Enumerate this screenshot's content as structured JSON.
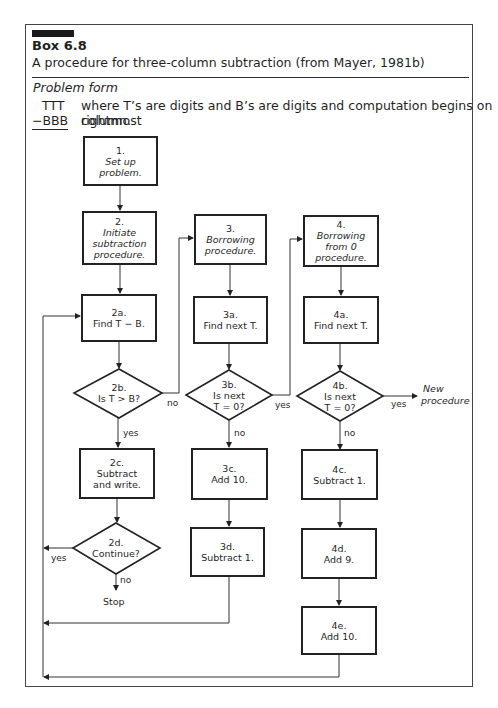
{
  "header": {
    "box_number": "Box 6.8",
    "caption": "A procedure for three-column subtraction (from Mayer, 1981b)"
  },
  "problem_form": {
    "title": "Problem form",
    "top_operand": "TTT",
    "bottom_operand": "−BBB",
    "description_line1": "where T’s are digits and B’s are digits and computation begins on rightmost",
    "description_line2": "column."
  },
  "nodes": {
    "n1": {
      "id": "1.",
      "text": "Set up",
      "text2": "problem.",
      "italic": true
    },
    "n2": {
      "id": "2.",
      "text": "Initiate",
      "text2": "subtraction",
      "text3": "procedure.",
      "italic": true
    },
    "n2a": {
      "id": "2a.",
      "text": "Find T − B."
    },
    "n2b": {
      "id": "2b.",
      "text": "Is T > B?"
    },
    "n2c": {
      "id": "2c.",
      "text": "Subtract",
      "text2": "and write."
    },
    "n2d": {
      "id": "2d.",
      "text": "Continue?"
    },
    "n3": {
      "id": "3.",
      "text": "Borrowing",
      "text2": "procedure.",
      "italic": true
    },
    "n3a": {
      "id": "3a.",
      "text": "Find next T."
    },
    "n3b": {
      "id": "3b.",
      "text": "Is next",
      "text2": "T = 0?"
    },
    "n3c": {
      "id": "3c.",
      "text": "Add 10."
    },
    "n3d": {
      "id": "3d.",
      "text": "Subtract 1."
    },
    "n4": {
      "id": "4.",
      "text": "Borrowing",
      "text2": "from 0",
      "text3": "procedure.",
      "italic": true
    },
    "n4a": {
      "id": "4a.",
      "text": "Find next T."
    },
    "n4b": {
      "id": "4b.",
      "text": "Is next",
      "text2": "T = 0?"
    },
    "n4c": {
      "id": "4c.",
      "text": "Subtract 1."
    },
    "n4d": {
      "id": "4d.",
      "text": "Add 9."
    },
    "n4e": {
      "id": "4e.",
      "text": "Add 10."
    }
  },
  "edge_labels": {
    "b2_no": "no",
    "b2_yes": "yes",
    "b3_yes": "yes",
    "b3_no": "no",
    "b4_yes": "yes",
    "b4_no": "no",
    "d2_yes": "yes",
    "d2_no": "no",
    "stop": "Stop",
    "new_procedure_1": "New",
    "new_procedure_2": "procedure"
  }
}
